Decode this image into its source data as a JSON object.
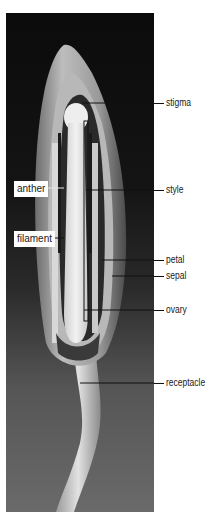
{
  "figure": {
    "labels_right": [
      {
        "id": "stigma",
        "text": "stigma",
        "y": 102
      },
      {
        "id": "style",
        "text": "style",
        "y": 190
      },
      {
        "id": "petal",
        "text": "petal",
        "y": 260
      },
      {
        "id": "sepal",
        "text": "sepal",
        "y": 276
      },
      {
        "id": "ovary",
        "text": "ovary",
        "y": 310
      },
      {
        "id": "receptacle",
        "text": "receptacle",
        "y": 383
      }
    ],
    "labels_left": [
      {
        "id": "anther",
        "text": "anther",
        "y": 188
      },
      {
        "id": "filament",
        "text": "filament",
        "y": 238
      }
    ],
    "colors": {
      "background_top": "#0b0b0b",
      "background_bottom": "#6a6a6a",
      "label_text": "#1a1a1a",
      "leader_line": "#111111"
    }
  }
}
